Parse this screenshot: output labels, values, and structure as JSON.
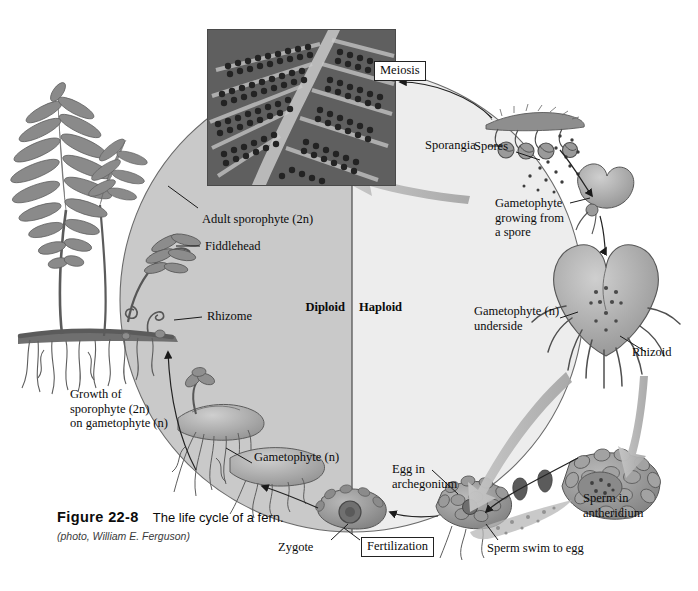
{
  "figure": {
    "number": "Figure 22-8",
    "title": "The life cycle of a fern.",
    "credit": "(photo, William E. Ferguson)"
  },
  "diagram": {
    "type": "biological-life-cycle",
    "organism": "fern",
    "phase_regions": [
      {
        "name": "diploid",
        "label": "Diploid",
        "side": "left",
        "fill": "#c9c9c9"
      },
      {
        "name": "haploid",
        "label": "Haploid",
        "side": "right",
        "fill": "#ededed"
      }
    ],
    "process_boxes": [
      {
        "name": "meiosis",
        "label": "Meiosis",
        "position": "top"
      },
      {
        "name": "fertilization",
        "label": "Fertilization",
        "position": "bottom"
      }
    ],
    "labels": [
      {
        "id": "adult-sporophyte",
        "text": "Adult sporophyte (2n)",
        "ploidy": "2n"
      },
      {
        "id": "fiddlehead",
        "text": "Fiddlehead",
        "ploidy": "2n"
      },
      {
        "id": "rhizome",
        "text": "Rhizome",
        "ploidy": "2n"
      },
      {
        "id": "growth-of-sporophyte",
        "text": "Growth of\nsporophyte (2n)\non gametophyte (n)",
        "ploidy": "2n"
      },
      {
        "id": "gametophyte-n",
        "text": "Gametophyte (n)",
        "ploidy": "n"
      },
      {
        "id": "zygote",
        "text": "Zygote",
        "ploidy": "2n"
      },
      {
        "id": "egg-in-archegonium",
        "text": "Egg in\narchegonium",
        "ploidy": "n"
      },
      {
        "id": "sperm-swim-to-egg",
        "text": "Sperm swim to egg",
        "ploidy": "n"
      },
      {
        "id": "sperm-in-antheridium",
        "text": "Sperm in\nantheridium",
        "ploidy": "n"
      },
      {
        "id": "rhizoid",
        "text": "Rhizoid",
        "ploidy": "n"
      },
      {
        "id": "gametophyte-underside",
        "text": "Gametophyte (n)\nunderside",
        "ploidy": "n"
      },
      {
        "id": "gametophyte-growing",
        "text": "Gametophyte\ngrowing from\na spore",
        "ploidy": "n"
      },
      {
        "id": "spores",
        "text": "Spores",
        "ploidy": "n"
      },
      {
        "id": "sporangia",
        "text": "Sporangia",
        "ploidy": "2n"
      }
    ],
    "photo_caption": "fern frond underside with rows of sori"
  },
  "colors": {
    "diploid_fill": "#c9c9c9",
    "haploid_fill": "#ededed",
    "arrow_gray": "#b4b4b4",
    "outline": "#4a4a4a",
    "text": "#0b0b0b"
  }
}
